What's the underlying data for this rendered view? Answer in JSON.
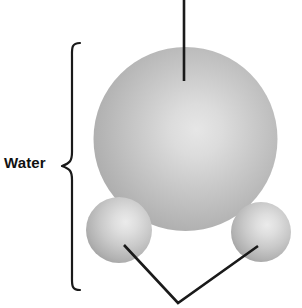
{
  "figure": {
    "width": 302,
    "height": 308,
    "background_color": "#ffffff",
    "label_water": "Water",
    "labels": {
      "water": "Water"
    },
    "colors": {
      "sphere_light": "#e8e8e8",
      "sphere_mid": "#b4b4b4",
      "sphere_dark": "#8e8e8e",
      "sphere_edge": "#9a9a9a",
      "line": "#1a1a1a",
      "brace": "#1a1a1a",
      "text": "#111111"
    },
    "atoms": [
      {
        "name": "oxygen-sphere",
        "role": "large-central-atom",
        "cx": 185.5,
        "cy": 139,
        "r": 92,
        "highlight_x": 200,
        "highlight_y": 126
      },
      {
        "name": "hydrogen-sphere-left",
        "role": "small-atom",
        "cx": 119,
        "cy": 230,
        "r": 33,
        "highlight_x": 128,
        "highlight_y": 220
      },
      {
        "name": "hydrogen-sphere-right",
        "role": "small-atom",
        "cx": 261,
        "cy": 232,
        "r": 30,
        "highlight_x": 269,
        "highlight_y": 222
      }
    ],
    "leader_lines": [
      {
        "name": "oxygen-leader-line",
        "x1": 184,
        "y1": 0,
        "x2": 184,
        "y2": 81
      },
      {
        "name": "hydrogen-leader-line-left",
        "x1": 124,
        "y1": 245,
        "x2": 178,
        "y2": 303
      },
      {
        "name": "hydrogen-leader-line-right",
        "x1": 258,
        "y1": 246,
        "x2": 178,
        "y2": 303
      }
    ],
    "brace": {
      "name": "water-brace",
      "x": 72,
      "top": 42,
      "bottom": 290,
      "mid": 166,
      "tip_x": 62
    }
  }
}
